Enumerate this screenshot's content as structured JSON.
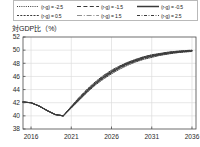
{
  "legend": {
    "entries": [
      {
        "label": "(r-g) = -2.5",
        "style": "dotted",
        "icon": "line-style-dotted-icon"
      },
      {
        "label": "(r-g) = -1.5",
        "style": "long-dash",
        "icon": "line-style-long-dash-icon"
      },
      {
        "label": "(r-g) = -0.5",
        "style": "solid",
        "icon": "line-style-solid-icon"
      },
      {
        "label": "(r-g) = 0.5",
        "style": "short-dash",
        "icon": "line-style-short-dash-icon"
      },
      {
        "label": "(r-g) = 1.5",
        "style": "dash-dot",
        "icon": "line-style-dash-dot-icon"
      },
      {
        "label": "(r-g) = 2.5",
        "style": "dash-dot-dot",
        "icon": "line-style-dash-dot-dot-icon"
      }
    ]
  },
  "axis_title": "対GDP比（%）",
  "chart_data": {
    "type": "line",
    "title": "",
    "subtitle": "",
    "xlabel": "",
    "ylabel": "対GDP比（%）",
    "xlim": [
      2015,
      2036.5
    ],
    "ylim": [
      38,
      52
    ],
    "grid": true,
    "legend_position": "top",
    "ytick_labels": [
      "38",
      "40",
      "42",
      "44",
      "46",
      "48",
      "50",
      "52"
    ],
    "yticks": [
      38,
      40,
      42,
      44,
      46,
      48,
      50,
      52
    ],
    "xtick_labels": [
      "2016",
      "2021",
      "2026",
      "2031",
      "2036"
    ],
    "xticks": [
      2016,
      2021,
      2026,
      2031,
      2036
    ],
    "x": [
      2015,
      2016,
      2017,
      2018,
      2019,
      2020,
      2021,
      2022,
      2023,
      2024,
      2025,
      2026,
      2027,
      2028,
      2029,
      2030,
      2031,
      2032,
      2033,
      2034,
      2035,
      2036
    ],
    "series": [
      {
        "name": "(r-g) = -2.5",
        "style": "dotted",
        "color": "#3a3a3a",
        "values": [
          42.1,
          42.0,
          41.5,
          40.8,
          40.2,
          40.0,
          41.2,
          42.4,
          43.6,
          44.7,
          45.6,
          46.4,
          47.1,
          47.7,
          48.2,
          48.6,
          48.9,
          49.2,
          49.4,
          49.6,
          49.7,
          49.8
        ]
      },
      {
        "name": "(r-g) = -1.5",
        "style": "long-dash",
        "color": "#3a3a3a",
        "values": [
          42.1,
          42.0,
          41.5,
          40.8,
          40.2,
          40.0,
          41.25,
          42.5,
          43.7,
          44.8,
          45.75,
          46.55,
          47.25,
          47.85,
          48.3,
          48.7,
          49.0,
          49.25,
          49.45,
          49.6,
          49.75,
          49.85
        ]
      },
      {
        "name": "(r-g) = -0.5",
        "style": "solid",
        "color": "#3a3a3a",
        "values": [
          42.1,
          42.0,
          41.5,
          40.8,
          40.2,
          40.0,
          41.3,
          42.55,
          43.8,
          44.9,
          45.85,
          46.65,
          47.35,
          47.95,
          48.4,
          48.8,
          49.1,
          49.35,
          49.55,
          49.7,
          49.8,
          49.9
        ]
      },
      {
        "name": "(r-g) = 0.5",
        "style": "short-dash",
        "color": "#3a3a3a",
        "values": [
          42.1,
          42.0,
          41.5,
          40.8,
          40.2,
          40.0,
          41.35,
          42.65,
          43.9,
          45.0,
          45.95,
          46.75,
          47.45,
          48.0,
          48.5,
          48.9,
          49.15,
          49.4,
          49.6,
          49.75,
          49.85,
          49.92
        ]
      },
      {
        "name": "(r-g) = 1.5",
        "style": "dash-dot",
        "color": "#3a3a3a",
        "values": [
          42.1,
          42.0,
          41.5,
          40.8,
          40.2,
          40.0,
          41.4,
          42.75,
          44.0,
          45.1,
          46.05,
          46.85,
          47.5,
          48.1,
          48.55,
          48.95,
          49.25,
          49.45,
          49.65,
          49.8,
          49.9,
          49.95
        ]
      },
      {
        "name": "(r-g) = 2.5",
        "style": "dash-dot-dot",
        "color": "#3a3a3a",
        "values": [
          42.1,
          42.0,
          41.5,
          40.8,
          40.2,
          40.0,
          41.45,
          42.85,
          44.1,
          45.2,
          46.15,
          46.95,
          47.6,
          48.15,
          48.6,
          49.0,
          49.3,
          49.5,
          49.7,
          49.82,
          49.92,
          50.0
        ]
      }
    ]
  }
}
